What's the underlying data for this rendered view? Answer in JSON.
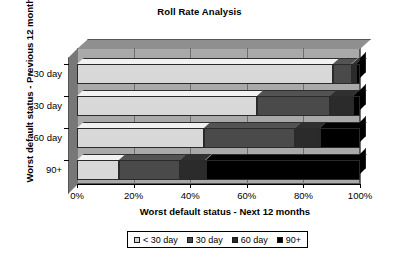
{
  "chart_data": {
    "type": "bar",
    "orientation": "horizontal",
    "stacked": true,
    "percent": true,
    "title": "Roll Rate Analysis",
    "xlabel": "Worst default status - Next 12 months",
    "ylabel": "Worst default status - Previous 12 months",
    "xlim": [
      0,
      100
    ],
    "grid": true,
    "legend_position": "bottom",
    "xticks": [
      "0%",
      "20%",
      "40%",
      "60%",
      "80%",
      "100%"
    ],
    "xtick_values": [
      0,
      20,
      40,
      60,
      80,
      100
    ],
    "categories": [
      "<30 day",
      "30 day",
      "60 day",
      "90+"
    ],
    "series": [
      {
        "name": "< 30 day",
        "color": "#d8d8d8",
        "values": [
          90.5,
          63.5,
          45.0,
          15.0
        ]
      },
      {
        "name": "30 day",
        "color": "#4a4a4a",
        "values": [
          6.5,
          26.0,
          32.0,
          21.5
        ]
      },
      {
        "name": "60 day",
        "color": "#2b2b2b",
        "values": [
          1.5,
          8.0,
          9.0,
          9.0
        ]
      },
      {
        "name": "90+",
        "color": "#000000",
        "values": [
          1.5,
          2.5,
          14.0,
          54.5
        ]
      }
    ],
    "colors": {
      "plot_background": "#a9a9a9",
      "plot_top_face": "#8f8f8f",
      "plot_side_face": "#777777",
      "gridline": "#6f6f6f",
      "text": "#000000",
      "page_background": "#ffffff"
    }
  },
  "legend": {
    "items": [
      {
        "label": "< 30 day",
        "color": "#d8d8d8"
      },
      {
        "label": "30 day",
        "color": "#4a4a4a"
      },
      {
        "label": "60 day",
        "color": "#2b2b2b"
      },
      {
        "label": "90+",
        "color": "#000000"
      }
    ]
  }
}
